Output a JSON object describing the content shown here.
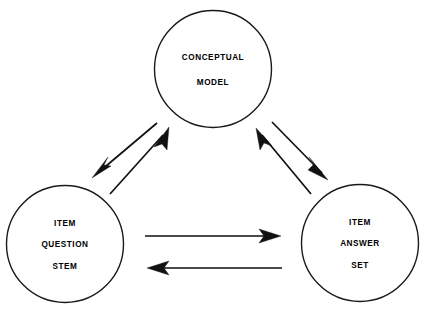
{
  "diagram": {
    "type": "cycle-diagram",
    "background_color": "#ffffff",
    "stroke_color": "#111111",
    "text_color": "#000000",
    "nodes": [
      {
        "id": "conceptual-model",
        "name": "conceptual-model-node",
        "lines": [
          "CONCEPTUAL",
          "MODEL"
        ],
        "line1": "CONCEPTUAL",
        "line2": "MODEL",
        "line3": "",
        "cx": 213,
        "cy": 69,
        "r": 58.5
      },
      {
        "id": "item-question-stem",
        "name": "item-question-stem-node",
        "lines": [
          "ITEM",
          "QUESTION",
          "STEM"
        ],
        "line1": "ITEM",
        "line2": "QUESTION",
        "line3": "STEM",
        "cx": 65,
        "cy": 244,
        "r": 58.5
      },
      {
        "id": "item-answer-set",
        "name": "item-answer-set-node",
        "lines": [
          "ITEM",
          "ANSWER",
          "SET"
        ],
        "line1": "ITEM",
        "line2": "ANSWER",
        "line3": "SET",
        "cx": 360,
        "cy": 243,
        "r": 58.5
      }
    ],
    "edges": [
      {
        "id": "model-to-stem",
        "name": "arrow-conceptual-model-to-item-question-stem",
        "from": "conceptual-model",
        "to": "item-question-stem",
        "direction": "down-left",
        "x1": 157,
        "y1": 123,
        "x2": 93,
        "y2": 177
      },
      {
        "id": "stem-to-model",
        "name": "arrow-item-question-stem-to-conceptual-model",
        "from": "item-question-stem",
        "to": "conceptual-model",
        "direction": "up-right",
        "x1": 110,
        "y1": 194,
        "x2": 169,
        "y2": 128
      },
      {
        "id": "model-to-answer",
        "name": "arrow-conceptual-model-to-item-answer-set",
        "from": "conceptual-model",
        "to": "item-answer-set",
        "direction": "down-right",
        "x1": 272,
        "y1": 122,
        "x2": 328,
        "y2": 180
      },
      {
        "id": "answer-to-model",
        "name": "arrow-item-answer-set-to-conceptual-model",
        "from": "item-answer-set",
        "to": "conceptual-model",
        "direction": "up-left",
        "x1": 311,
        "y1": 194,
        "x2": 256,
        "y2": 128
      },
      {
        "id": "stem-to-answer",
        "name": "arrow-item-question-stem-to-item-answer-set",
        "from": "item-question-stem",
        "to": "item-answer-set",
        "direction": "right",
        "x1": 145,
        "y1": 236,
        "x2": 280,
        "y2": 236
      },
      {
        "id": "answer-to-stem",
        "name": "arrow-item-answer-set-to-item-question-stem",
        "from": "item-answer-set",
        "to": "item-question-stem",
        "direction": "left",
        "x1": 282,
        "y1": 268,
        "x2": 148,
        "y2": 268
      }
    ]
  }
}
